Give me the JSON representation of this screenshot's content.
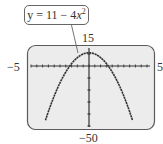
{
  "chart_data": {
    "type": "line",
    "title": "",
    "equation_label": "y = 11 − 4x²",
    "equation": "y = 11 - 4x^2",
    "xlabel": "",
    "ylabel": "",
    "xlim": [
      -5,
      5
    ],
    "ylim": [
      -50,
      15
    ],
    "x_tick_step": 0.5,
    "y_tick_step": 10,
    "window_labels": {
      "xmin": "−5",
      "xmax": "5",
      "ymin": "−50",
      "ymax": "15"
    },
    "grid": false,
    "legend": "callout",
    "series": [
      {
        "name": "y = 11 − 4x²",
        "x": [
          -3.75,
          -3,
          -2,
          -1.66,
          -1,
          0,
          1,
          1.66,
          2,
          3,
          3.75
        ],
        "y": [
          -45.25,
          -25,
          -5,
          0,
          7,
          11,
          7,
          0,
          -5,
          -25,
          -45.25
        ]
      }
    ]
  },
  "labels": {
    "xmin": "−5",
    "xmax": "5",
    "ymax": "15",
    "ymin": "−50",
    "callout_prefix": "y = 11 − 4",
    "callout_var": "x",
    "callout_exp": "2"
  },
  "colors": {
    "screen_bg": "#ececec",
    "screen_border": "#5a5a5a",
    "curve": "#333333",
    "axis": "#333333"
  }
}
